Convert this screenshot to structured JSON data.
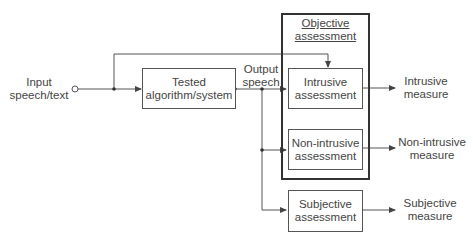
{
  "diagram": {
    "input": {
      "line1": "Input",
      "line2": "speech/text"
    },
    "tested": {
      "line1": "Tested",
      "line2": "algorithm/system"
    },
    "output": {
      "line1": "Output",
      "line2": "speech"
    },
    "objective_group": {
      "line1": "Objective",
      "line2": "assessment"
    },
    "intrusive_box": {
      "line1": "Intrusive",
      "line2": "assessment"
    },
    "nonintrusive_box": {
      "line1": "Non-intrusive",
      "line2": "assessment"
    },
    "subjective_box": {
      "line1": "Subjective",
      "line2": "assessment"
    },
    "intrusive_measure": {
      "line1": "Intrusive",
      "line2": "measure"
    },
    "nonintrusive_measure": {
      "line1": "Non-intrusive",
      "line2": "measure"
    },
    "subjective_measure": {
      "line1": "Subjective",
      "line2": "measure"
    },
    "colors": {
      "line": "#444444",
      "frame": "#333333",
      "text": "#444444"
    }
  }
}
